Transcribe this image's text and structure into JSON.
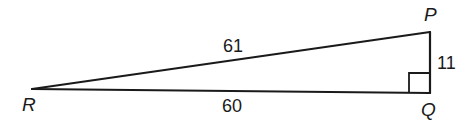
{
  "diagram": {
    "type": "right-triangle",
    "vertices": {
      "R": {
        "label": "R",
        "x": 32,
        "y": 89
      },
      "P": {
        "label": "P",
        "x": 430,
        "y": 32
      },
      "Q": {
        "label": "Q",
        "x": 430,
        "y": 93
      }
    },
    "sides": {
      "RP": {
        "label": "61",
        "from": "R",
        "to": "P"
      },
      "RQ": {
        "label": "60",
        "from": "R",
        "to": "Q"
      },
      "PQ": {
        "label": "11",
        "from": "P",
        "to": "Q"
      }
    },
    "right_angle_at": "Q",
    "colors": {
      "stroke": "#1a1a1a",
      "background": "#ffffff"
    }
  }
}
